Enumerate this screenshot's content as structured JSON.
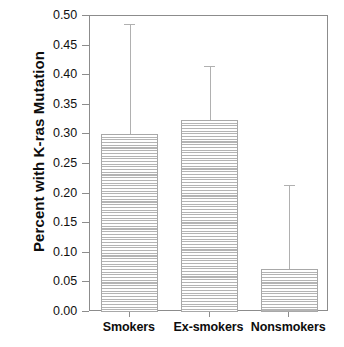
{
  "chart_data": {
    "type": "bar",
    "title": "",
    "xlabel": "",
    "ylabel": "Percent with K-ras Mutation",
    "categories": [
      "Smokers",
      "Ex-smokers",
      "Nonsmokers"
    ],
    "values": [
      0.3,
      0.325,
      0.072
    ],
    "error_upper": [
      0.487,
      0.415,
      0.215
    ],
    "ylim": [
      0.0,
      0.5
    ],
    "ytick_labels": [
      "0.00",
      "0.05",
      "0.10",
      "0.15",
      "0.20",
      "0.25",
      "0.30",
      "0.35",
      "0.40",
      "0.45",
      "0.50"
    ],
    "ytick_values": [
      0.0,
      0.05,
      0.1,
      0.15,
      0.2,
      0.25,
      0.3,
      0.35,
      0.4,
      0.45,
      0.5
    ],
    "grid": false,
    "legend": null,
    "bar_fill": "horizontal-line-hatch",
    "colors": {
      "axis": "#8c8c8c",
      "bar_edge": "#a8a8a8",
      "bar_hatch": "#b4b4b4",
      "error_bar": "#b0b0b0",
      "text": "#0d0d0d",
      "background": "#ffffff"
    }
  }
}
